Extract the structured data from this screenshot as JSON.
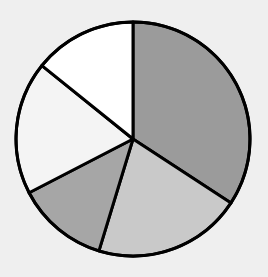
{
  "chart_data": {
    "type": "pie",
    "title": "",
    "start_angle_deg": 0,
    "direction": "clockwise",
    "labels": [
      "Slice 1",
      "Slice 2",
      "Slice 3",
      "Slice 4",
      "Slice 5"
    ],
    "values": [
      34.2,
      20.5,
      12.7,
      18.4,
      14.2
    ],
    "colors": [
      "#9b9b9b",
      "#c9c9c9",
      "#a6a6a6",
      "#f4f4f4",
      "#ffffff"
    ],
    "legend": "none",
    "data_labels": "none"
  },
  "style": {
    "background": "#efefef",
    "stroke": "#000000",
    "stroke_width": 3,
    "center_x": 133,
    "center_y": 139,
    "radius": 117
  }
}
